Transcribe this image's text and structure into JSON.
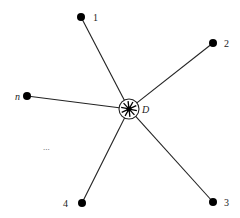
{
  "diagram": {
    "hub": {
      "id": "D",
      "label": "D",
      "x": 129,
      "y": 109,
      "r": 10,
      "label_x": 142,
      "label_y": 113
    },
    "nodes": [
      {
        "id": "1",
        "label": "1",
        "x": 81,
        "y": 17,
        "label_x": 93,
        "label_y": 21,
        "italic": false
      },
      {
        "id": "2",
        "label": "2",
        "x": 213,
        "y": 43,
        "label_x": 224,
        "label_y": 47,
        "italic": false
      },
      {
        "id": "3",
        "label": "3",
        "x": 213,
        "y": 202,
        "label_x": 224,
        "label_y": 206,
        "italic": false
      },
      {
        "id": "4",
        "label": "4",
        "x": 82,
        "y": 203,
        "label_x": 63,
        "label_y": 207,
        "italic": false
      },
      {
        "id": "n",
        "label": "n",
        "x": 27,
        "y": 96,
        "label_x": 15,
        "label_y": 100,
        "italic": true
      }
    ],
    "ellipsis": {
      "text": "...",
      "x": 43,
      "y": 150
    },
    "colors": {
      "line": "#222222",
      "node": "#000000",
      "background": "#ffffff"
    }
  }
}
